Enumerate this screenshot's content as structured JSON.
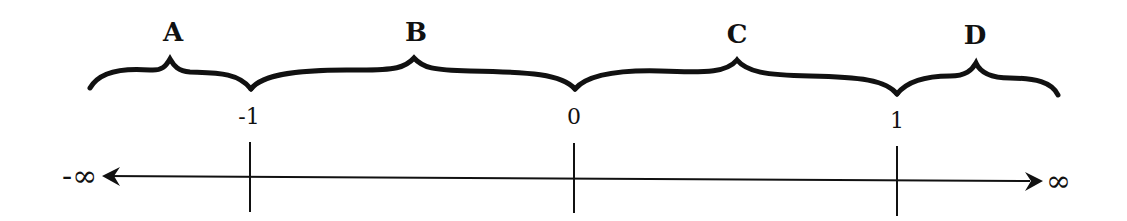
{
  "diagram": {
    "type": "number-line-with-intervals",
    "regions": [
      {
        "label": "A",
        "from": "-∞",
        "to": "-1"
      },
      {
        "label": "B",
        "from": "-1",
        "to": "0"
      },
      {
        "label": "C",
        "from": "0",
        "to": "1"
      },
      {
        "label": "D",
        "from": "1",
        "to": "∞"
      }
    ],
    "ticks": [
      {
        "label": "-1"
      },
      {
        "label": "0"
      },
      {
        "label": "1"
      }
    ],
    "left_end_label": "-∞",
    "right_end_label": "∞",
    "colors": {
      "ink": "#111111",
      "background": "#ffffff"
    }
  }
}
